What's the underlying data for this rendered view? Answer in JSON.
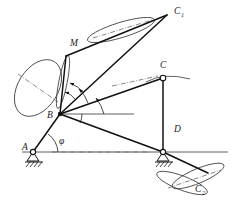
{
  "figure": {
    "kind": "kinematic-linkage-diagram",
    "background_color": "#ffffff",
    "line_color": "#111111",
    "accent_color": "#3a3a3a",
    "width": 232,
    "height": 203
  },
  "labels": {
    "point_a": "A",
    "point_b": "B",
    "point_c": "C",
    "point_c1_base": "C",
    "point_c1_sub": "1",
    "point_c2_base": "C",
    "point_c2_sub": "2",
    "point_d": "D",
    "point_m": "M",
    "angle_phi": "φ"
  },
  "geometry": {
    "points": {
      "A": {
        "x": 33,
        "y": 152
      },
      "B": {
        "x": 60,
        "y": 114
      },
      "C": {
        "x": 163,
        "y": 78
      },
      "D": {
        "x": 163,
        "y": 152
      },
      "C1": {
        "x": 167,
        "y": 15
      },
      "C2": {
        "x": 205,
        "y": 178
      },
      "M_tip": {
        "x": 66,
        "y": 56
      }
    },
    "links": [
      {
        "name": "link-A-B",
        "from": "A",
        "to": "B"
      },
      {
        "name": "link-B-C",
        "from": "B",
        "to": "C"
      },
      {
        "name": "link-C-D",
        "from": "C",
        "to": "D"
      },
      {
        "name": "link-B-D",
        "from": "B",
        "to": "D"
      },
      {
        "name": "link-B-C1",
        "from": "B",
        "to": "C1"
      },
      {
        "name": "link-C1-top-ray",
        "from": "C1",
        "to": "M_tip"
      },
      {
        "name": "link-D-C2",
        "from": "D",
        "to": "C2"
      },
      {
        "name": "link-B-M",
        "from": "B",
        "to": "M_tip"
      }
    ],
    "supports": [
      {
        "name": "pin-support-A",
        "at": "A",
        "type": "pin-hatched"
      },
      {
        "name": "pin-support-D",
        "at": "D",
        "type": "pin-hatched"
      }
    ],
    "reference_lines": [
      {
        "name": "ground-line-horizontal",
        "y": 152,
        "x1": 22,
        "x2": 228,
        "style": "solid"
      },
      {
        "name": "horizontal-ref-from-B",
        "y": 114,
        "x1": 60,
        "x2": 133,
        "style": "solid"
      },
      {
        "name": "axis-dashdot-A-D",
        "style": "dash-dot"
      },
      {
        "name": "axis-dashdot-B-C",
        "style": "dash-dot"
      }
    ],
    "ellipses": [
      {
        "name": "ellipse-M-left",
        "cx": 38,
        "cy": 88,
        "rx": 31,
        "ry": 20,
        "rotate": -58
      },
      {
        "name": "ellipse-M-narrow",
        "cx": 63,
        "cy": 82,
        "rx": 27,
        "ry": 4.2,
        "rotate": -78
      },
      {
        "name": "ellipse-C1-upper",
        "cx": 122,
        "cy": 30,
        "rx": 35,
        "ry": 7.5,
        "rotate": -16
      },
      {
        "name": "ellipse-C2-lower",
        "cx": 196,
        "cy": 180,
        "rx": 29,
        "ry": 7.5,
        "rotate": -22
      },
      {
        "name": "ellipse-C2-cross",
        "cx": 185,
        "cy": 181,
        "rx": 28,
        "ry": 7,
        "rotate": 20
      }
    ],
    "angle_arcs": [
      {
        "name": "angle-arc-phi-at-A",
        "vertex": "A",
        "label": "φ"
      },
      {
        "name": "angle-arc-1-at-B",
        "vertex": "B"
      },
      {
        "name": "angle-arc-2-at-B",
        "vertex": "B"
      },
      {
        "name": "angle-arc-3-at-B",
        "vertex": "B"
      },
      {
        "name": "angle-arc-4-at-B",
        "vertex": "B"
      }
    ]
  }
}
